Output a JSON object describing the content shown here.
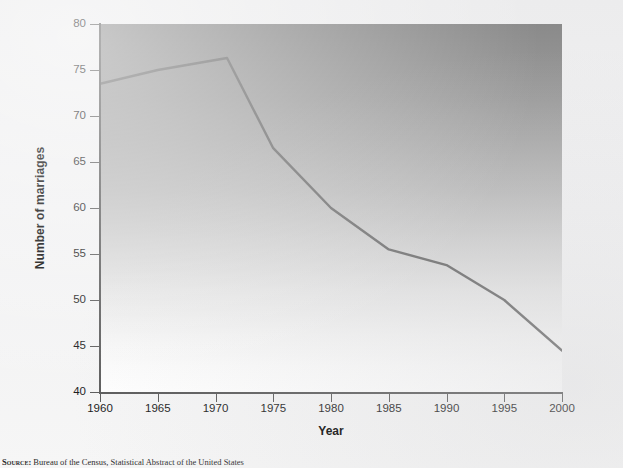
{
  "figure": {
    "source_note_lead": "Source:",
    "source_note_text": " Bureau of the Census, Statistical Abstract of the United States"
  },
  "chart_data": {
    "type": "line",
    "title": "",
    "xlabel": "Year",
    "ylabel": "Number of marriages",
    "xlim": [
      1960,
      2000
    ],
    "ylim": [
      40,
      80
    ],
    "xticks": [
      1960,
      1965,
      1970,
      1975,
      1980,
      1985,
      1990,
      1995,
      2000
    ],
    "xtick_labels": [
      "1960",
      "1965",
      "1970",
      "1975",
      "1980",
      "1985",
      "1990",
      "1995",
      "2000"
    ],
    "yticks": [
      40,
      45,
      50,
      55,
      60,
      65,
      70,
      75,
      80
    ],
    "ytick_labels": [
      "40",
      "45",
      "50",
      "55",
      "60",
      "65",
      "70",
      "75",
      "80"
    ],
    "grid": false,
    "legend": false,
    "legend_position": "none",
    "line_color": "#6b6b6b",
    "line_width": 2.4,
    "plot_background": "vertical gradient dark grey (top) to white (bottom)",
    "plot_bg_top_color": "#8a8a8a",
    "plot_bg_bottom_color": "#fefefe",
    "axis_color": "#5a5a5a",
    "series": [
      {
        "name": "Number of marriages",
        "x": [
          1960,
          1965,
          1971,
          1975,
          1980,
          1985,
          1990,
          1995,
          2000
        ],
        "values": [
          73.5,
          75.0,
          76.3,
          66.5,
          60.0,
          55.5,
          53.8,
          50.0,
          44.5
        ]
      }
    ]
  }
}
